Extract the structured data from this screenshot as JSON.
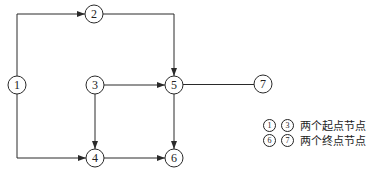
{
  "diagram": {
    "type": "network-flow",
    "nodes": [
      {
        "id": "1",
        "label": "1",
        "x": 17,
        "y": 85
      },
      {
        "id": "2",
        "label": "2",
        "x": 94,
        "y": 14
      },
      {
        "id": "3",
        "label": "3",
        "x": 95,
        "y": 85
      },
      {
        "id": "4",
        "label": "4",
        "x": 95,
        "y": 158
      },
      {
        "id": "5",
        "label": "5",
        "x": 174,
        "y": 85
      },
      {
        "id": "6",
        "label": "6",
        "x": 174,
        "y": 158
      },
      {
        "id": "7",
        "label": "7",
        "x": 263,
        "y": 84
      }
    ],
    "edges": [
      {
        "from": "1",
        "to": "2",
        "arrow": true
      },
      {
        "from": "1",
        "to": "4",
        "arrow": true
      },
      {
        "from": "2",
        "to": "5",
        "arrow": true
      },
      {
        "from": "3",
        "to": "5",
        "arrow": true
      },
      {
        "from": "3",
        "to": "4",
        "arrow": true
      },
      {
        "from": "4",
        "to": "6",
        "arrow": true
      },
      {
        "from": "5",
        "to": "6",
        "arrow": true
      },
      {
        "from": "5",
        "to": "7",
        "arrow": false
      }
    ]
  },
  "legend": {
    "start": {
      "marks": [
        "1",
        "3"
      ],
      "text": "两个起点节点"
    },
    "end": {
      "marks": [
        "6",
        "7"
      ],
      "text": "两个终点节点"
    }
  }
}
